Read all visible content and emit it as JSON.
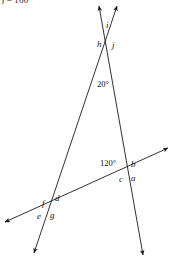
{
  "figure": {
    "cut_text": ") = 160°",
    "stroke_color": "#1a1a1a",
    "background_color": "#ffffff",
    "angle_measures": [
      {
        "id": "angle-20",
        "text": "20°",
        "x": 97,
        "y": 80
      },
      {
        "id": "angle-120",
        "text": "120°",
        "x": 100,
        "y": 159
      }
    ],
    "angle_labels": [
      {
        "id": "a",
        "text": "a",
        "x": 131,
        "y": 174
      },
      {
        "id": "b",
        "text": "b",
        "x": 131,
        "y": 160
      },
      {
        "id": "c",
        "text": "c",
        "x": 119,
        "y": 175
      },
      {
        "id": "d",
        "text": "d",
        "x": 55,
        "y": 194
      },
      {
        "id": "e",
        "text": "e",
        "x": 37,
        "y": 212
      },
      {
        "id": "f",
        "text": "f",
        "x": 42,
        "y": 199
      },
      {
        "id": "g",
        "text": "g",
        "x": 50,
        "y": 211
      },
      {
        "id": "h",
        "text": "h",
        "x": 97,
        "y": 40
      },
      {
        "id": "i",
        "text": "i",
        "x": 106,
        "y": 21
      },
      {
        "id": "j",
        "text": "j",
        "x": 112,
        "y": 41
      }
    ],
    "lines": [
      {
        "id": "line-left-slanted",
        "from": {
          "x": 117,
          "y": 6
        },
        "to": {
          "x": 34,
          "y": 253
        },
        "arrow_start": true,
        "arrow_end": true
      },
      {
        "id": "line-right-slanted",
        "from": {
          "x": 99,
          "y": 6
        },
        "to": {
          "x": 143,
          "y": 255
        },
        "arrow_start": true,
        "arrow_end": true
      },
      {
        "id": "line-transversal",
        "from": {
          "x": 5,
          "y": 222
        },
        "to": {
          "x": 168,
          "y": 148
        },
        "arrow_start": true,
        "arrow_end": true
      }
    ],
    "intersections": [
      {
        "id": "top-vertex",
        "x": 110,
        "y": 40
      },
      {
        "id": "right-vertex",
        "x": 128,
        "y": 172
      },
      {
        "id": "left-vertex",
        "x": 48,
        "y": 205
      }
    ]
  }
}
